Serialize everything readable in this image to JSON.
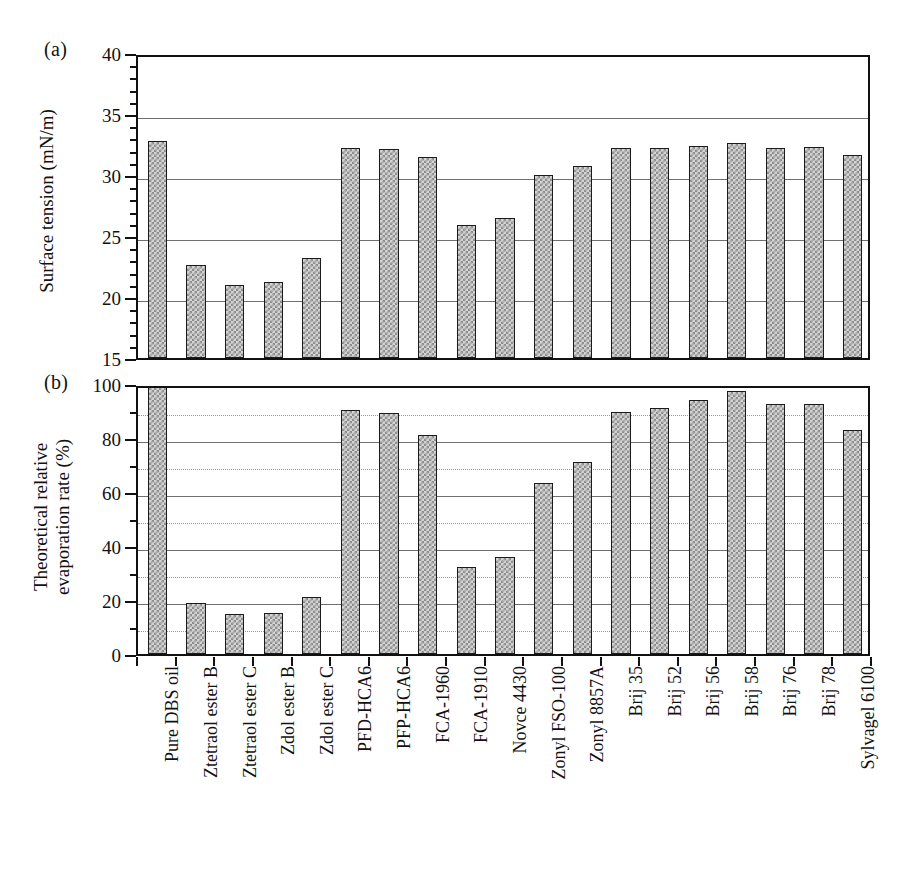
{
  "figure": {
    "panels": [
      {
        "tag": "(a)"
      },
      {
        "tag": "(b)"
      }
    ]
  },
  "chart_data": [
    {
      "type": "bar",
      "panel": "(a)",
      "title": "",
      "xlabel": "",
      "ylabel": "Surface tension (mN/m)",
      "ylim": [
        15,
        40
      ],
      "ytick_labels": [
        "15",
        "20",
        "25",
        "30",
        "35",
        "40"
      ],
      "ytick_values": [
        15,
        20,
        25,
        30,
        35,
        40
      ],
      "minor_tick_step": 1,
      "gridlines_major": [
        20,
        25,
        30,
        35
      ],
      "gridlines_minor": [],
      "grid": true,
      "legend": "none",
      "categories": [
        "Pure DBS oil",
        "Ztetraol ester B",
        "Ztetraol ester C",
        "Zdol ester B",
        "Zdol ester C",
        "PFD-HCA6",
        "PFP-HCA6",
        "FCA-1960",
        "FCA-1910",
        "Novce 4430",
        "Zonyl FSO-100",
        "Zonyl 8857A",
        "Brij 35",
        "Brij 52",
        "Brij 56",
        "Brij 58",
        "Brij 76",
        "Brij 78",
        "Sylvagel 6100"
      ],
      "values": [
        32.8,
        22.6,
        21.0,
        21.2,
        23.2,
        32.2,
        32.1,
        31.5,
        25.9,
        26.5,
        30.0,
        30.7,
        32.2,
        32.2,
        32.35,
        32.6,
        32.25,
        32.3,
        31.6
      ]
    },
    {
      "type": "bar",
      "panel": "(b)",
      "title": "",
      "xlabel": "",
      "ylabel": "Theoretical relative evaporation rate (%)",
      "ylabel_line1": "Theoretical relative",
      "ylabel_line2": "evaporation rate (%)",
      "ylim": [
        0,
        100
      ],
      "ytick_labels": [
        "0",
        "20",
        "40",
        "60",
        "80",
        "100"
      ],
      "ytick_values": [
        0,
        20,
        40,
        60,
        80,
        100
      ],
      "minor_tick_step": 10,
      "gridlines_major": [
        20,
        40,
        60,
        80
      ],
      "gridlines_minor": [
        10,
        30,
        50,
        70,
        90
      ],
      "grid": true,
      "legend": "none",
      "categories": [
        "Pure DBS oil",
        "Ztetraol ester B",
        "Ztetraol ester C",
        "Zdol ester B",
        "Zdol ester C",
        "PFD-HCA6",
        "PFP-HCA6",
        "FCA-1960",
        "FCA-1910",
        "Novce 4430",
        "Zonyl FSO-100",
        "Zonyl 8857A",
        "Brij 35",
        "Brij 52",
        "Brij 56",
        "Brij 58",
        "Brij 76",
        "Brij 78",
        "Sylvagel 6100"
      ],
      "values": [
        100,
        19,
        15,
        15.3,
        21,
        90.3,
        89.2,
        81,
        32.3,
        36,
        63.5,
        71,
        89.6,
        91,
        94,
        97.5,
        92.5,
        92.5,
        83
      ]
    }
  ]
}
